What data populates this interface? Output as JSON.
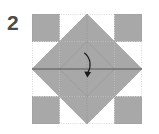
{
  "diagram": {
    "step_label": "2",
    "figure_name": "folded-square-star-pattern",
    "colors": {
      "paper_fill": "#a8a8a8",
      "background": "#ffffff",
      "crease_line": "#9a9a9a",
      "fold_line": "#555555",
      "arrow": "#1a1a1a",
      "step_number": "#4a4a4a",
      "border": "#b5b5b5"
    },
    "canvas": {
      "width": 110,
      "height": 110,
      "origin_x": 32,
      "origin_y": 14
    },
    "shapes": [
      {
        "name": "corner-square-top-left",
        "type": "square",
        "points": "0,0 27.5,0 27.5,27.5 0,27.5"
      },
      {
        "name": "corner-square-top-right",
        "type": "square",
        "points": "82.5,0 110,0 110,27.5 82.5,27.5"
      },
      {
        "name": "corner-square-bottom-left",
        "type": "square",
        "points": "0,82.5 27.5,82.5 27.5,110 0,110"
      },
      {
        "name": "corner-square-bottom-right",
        "type": "square",
        "points": "82.5,82.5 110,82.5 110,110 82.5,110"
      },
      {
        "name": "star-point-top",
        "type": "triangle",
        "points": "55,0 82.5,27.5 27.5,27.5"
      },
      {
        "name": "star-point-bottom",
        "type": "triangle",
        "points": "55,110 27.5,82.5 82.5,82.5"
      },
      {
        "name": "star-point-left",
        "type": "triangle",
        "points": "0,55 27.5,27.5 27.5,82.5"
      },
      {
        "name": "star-point-right",
        "type": "triangle",
        "points": "110,55 82.5,82.5 82.5,27.5"
      },
      {
        "name": "center-diamond",
        "type": "diamond",
        "points": "55,27.5 82.5,55 55,82.5 27.5,55"
      },
      {
        "name": "center-square-band",
        "type": "square",
        "points": "27.5,27.5 82.5,27.5 82.5,82.5 27.5,82.5"
      }
    ],
    "crease_lines": [
      {
        "name": "crease-vertical-center",
        "x1": 55,
        "y1": 0,
        "x2": 55,
        "y2": 110,
        "style": "dotted"
      },
      {
        "name": "crease-vertical-left",
        "x1": 27.5,
        "y1": 0,
        "x2": 27.5,
        "y2": 110,
        "style": "dotted"
      },
      {
        "name": "crease-vertical-right",
        "x1": 82.5,
        "y1": 0,
        "x2": 82.5,
        "y2": 110,
        "style": "dotted"
      },
      {
        "name": "crease-horizontal-top",
        "x1": 0,
        "y1": 27.5,
        "x2": 110,
        "y2": 27.5,
        "style": "dotted"
      },
      {
        "name": "crease-horizontal-bottom",
        "x1": 0,
        "y1": 82.5,
        "x2": 110,
        "y2": 82.5,
        "style": "dotted"
      },
      {
        "name": "crease-border-top",
        "x1": 0,
        "y1": 0,
        "x2": 110,
        "y2": 0,
        "style": "dotted"
      },
      {
        "name": "crease-border-bottom",
        "x1": 0,
        "y1": 110,
        "x2": 110,
        "y2": 110,
        "style": "dotted"
      },
      {
        "name": "crease-border-left",
        "x1": 0,
        "y1": 0,
        "x2": 0,
        "y2": 110,
        "style": "dotted"
      },
      {
        "name": "crease-border-right",
        "x1": 110,
        "y1": 0,
        "x2": 110,
        "y2": 110,
        "style": "dotted"
      }
    ],
    "fold_lines": [
      {
        "name": "fold-horizontal-center",
        "x1": 0,
        "y1": 55,
        "x2": 110,
        "y2": 55,
        "style": "solid"
      }
    ],
    "arrow": {
      "name": "fold-arrow-curved-down",
      "path": "M 52.5 39 C 58.5 44 59 52 55.5 58.5",
      "head_points": "55.5,63 52.6,57.2 58.6,57.6",
      "direction": "down"
    }
  }
}
